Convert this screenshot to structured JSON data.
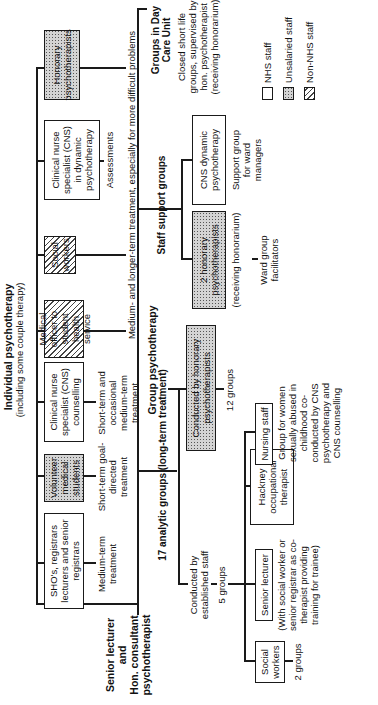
{
  "diagram": {
    "root": {
      "title": "Senior lecturer and Hon. consultant psychotherapist",
      "line1": "Senior lecturer",
      "line2": "and",
      "line3": "Hon. consultant",
      "line4": "psychotherapist"
    },
    "individual": {
      "title": "Individual psychotherapy",
      "subtitle": "(including some couple therapy)",
      "providers": [
        {
          "label": "SHO's, registrars lecturers and senior registrars",
          "type": "NHS staff",
          "note": "Medium-term treatment"
        },
        {
          "label": "Volunteer medical students",
          "type": "Unsalaried staff",
          "note": "Short-term goal-directed treatment"
        },
        {
          "label": "Clinical nurse specialist (CNS) counselling",
          "type": "NHS staff",
          "note": "Short-term and occasional medium-term treatment"
        },
        {
          "label": "Medical officer to student health service",
          "type": "Non-NHS staff",
          "note": ""
        },
        {
          "label": "Social workers",
          "type": "Non-NHS staff",
          "note": ""
        },
        {
          "label": "Clinical nurse specialist (CNS) in dynamic psychotherapy",
          "type": "NHS staff",
          "note": "Assessments"
        },
        {
          "label": "Honorary psychotherapists",
          "type": "Unsalaried staff",
          "note": ""
        }
      ],
      "shared_note": "Medium- and longer-term treatment, especially for more difficult problems"
    },
    "group": {
      "title": "Group psychotherapy",
      "analytic": {
        "title": "17 analytic groups (long-term treatment)",
        "established": {
          "label": "Conducted by established staff",
          "count": "5 groups",
          "children": [
            {
              "label": "Social workers",
              "note": "2 groups"
            },
            {
              "label": "Senior lecturer",
              "note": "(With social worker or senior registrar as co-therapist providing training for trainee)"
            },
            {
              "label": "Hackney occupational therapist",
              "note": ""
            },
            {
              "label": "Nursing staff",
              "note": "Group for women sexually abused in childhood co-conducted by CNS psychotherapy and CNS counselling"
            }
          ]
        },
        "honorary": {
          "label": "Conducted by honorary psychotherapists",
          "count": "12 groups"
        }
      },
      "staff_support": {
        "title": "Staff support groups",
        "children": [
          {
            "label": "2 honorary psychotherapists",
            "note1": "(receiving honorarium)",
            "note2": "Ward group facilitators"
          },
          {
            "label": "CNS dynamic psychotherapy",
            "note1": "Support group for ward managers",
            "note2": ""
          }
        ]
      },
      "day_care": {
        "title": "Groups in Day Care Unit",
        "note": "Closed short life groups, supervised by hon. psychotherapist (receiving honorarium)"
      }
    },
    "legend": [
      {
        "label": "NHS staff",
        "pattern": "plain"
      },
      {
        "label": "Unsalaried staff",
        "pattern": "dotted"
      },
      {
        "label": "Non-NHS staff",
        "pattern": "hatched"
      }
    ]
  },
  "colors": {
    "line": "#1a1a1a",
    "background": "#ffffff",
    "dotted_fill": "#d4d4d4"
  }
}
